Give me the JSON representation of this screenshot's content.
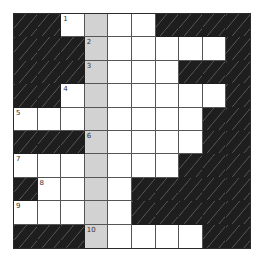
{
  "puzzle": {
    "rows": 10,
    "cols": 10,
    "legend": {
      "B": "black",
      "W": "white",
      "G": "highlighted-column"
    },
    "grid": [
      [
        "B",
        "B",
        "W",
        "G",
        "W",
        "W",
        "B",
        "B",
        "B",
        "B"
      ],
      [
        "B",
        "B",
        "B",
        "G",
        "W",
        "W",
        "W",
        "W",
        "W",
        "B"
      ],
      [
        "B",
        "B",
        "B",
        "G",
        "W",
        "W",
        "W",
        "B",
        "B",
        "B"
      ],
      [
        "B",
        "B",
        "W",
        "G",
        "W",
        "W",
        "W",
        "W",
        "W",
        "B"
      ],
      [
        "W",
        "W",
        "W",
        "G",
        "W",
        "W",
        "W",
        "W",
        "B",
        "B"
      ],
      [
        "B",
        "B",
        "B",
        "G",
        "W",
        "W",
        "W",
        "W",
        "B",
        "B"
      ],
      [
        "W",
        "W",
        "W",
        "G",
        "W",
        "W",
        "W",
        "B",
        "B",
        "B"
      ],
      [
        "B",
        "W",
        "W",
        "G",
        "W",
        "B",
        "B",
        "B",
        "B",
        "B"
      ],
      [
        "W",
        "W",
        "W",
        "G",
        "W",
        "B",
        "B",
        "B",
        "B",
        "B"
      ],
      [
        "B",
        "B",
        "B",
        "G",
        "W",
        "W",
        "W",
        "W",
        "B",
        "B"
      ]
    ],
    "numbers": [
      {
        "row": 0,
        "col": 2,
        "label": "1"
      },
      {
        "row": 1,
        "col": 3,
        "label": "2"
      },
      {
        "row": 2,
        "col": 3,
        "label": "3"
      },
      {
        "row": 3,
        "col": 2,
        "label": "4"
      },
      {
        "row": 4,
        "col": 0,
        "label": "5"
      },
      {
        "row": 5,
        "col": 3,
        "label": "6"
      },
      {
        "row": 6,
        "col": 0,
        "label": "7"
      },
      {
        "row": 7,
        "col": 1,
        "label": "8"
      },
      {
        "row": 8,
        "col": 0,
        "label": "9"
      },
      {
        "row": 9,
        "col": 3,
        "label": "10"
      }
    ],
    "colors": {
      "black": "#1e1e1e",
      "white": "#ffffff",
      "highlight": "#d2d2d2",
      "line": "#555555"
    }
  }
}
